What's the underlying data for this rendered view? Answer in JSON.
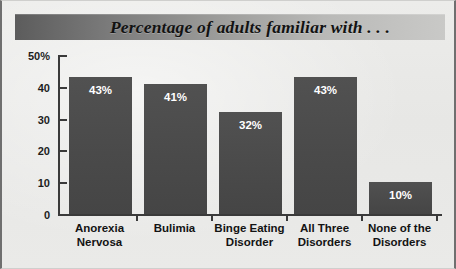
{
  "figure": {
    "title": "Percentage of adults familiar with . . .",
    "background_color": "#e9e9e7",
    "bar_color": "#4b4b4b",
    "axis_color": "#3a3a3a",
    "title_text_color": "#121212"
  },
  "chart_data": {
    "type": "bar",
    "title": "Percentage of adults familiar with . . .",
    "xlabel": "",
    "ylabel": "",
    "ylim": [
      0,
      50
    ],
    "grid": false,
    "legend": false,
    "categories": [
      "Anorexia\nNervosa",
      "Bulimia",
      "Binge Eating\nDisorder",
      "All Three\nDisorders",
      "None of the\nDisorders"
    ],
    "values": [
      43,
      41,
      32,
      43,
      10
    ],
    "data_labels": [
      "43%",
      "41%",
      "32%",
      "43%",
      "10%"
    ],
    "ytick_values": [
      50,
      40,
      30,
      20,
      10,
      0
    ],
    "ytick_labels": [
      "50%",
      "40",
      "30",
      "20",
      "10",
      "0"
    ]
  }
}
